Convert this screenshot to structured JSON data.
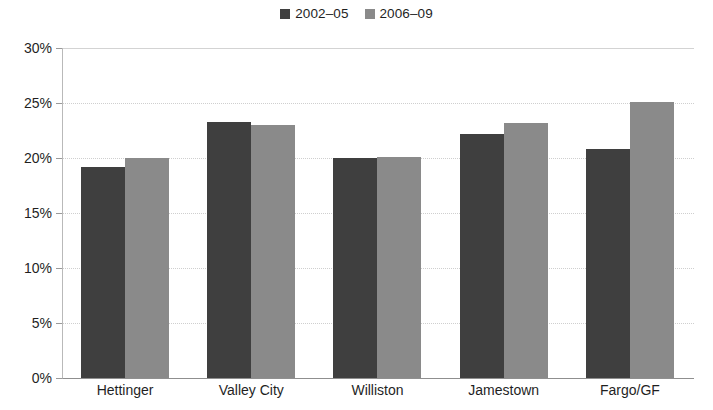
{
  "chart_data": {
    "type": "bar",
    "title": "",
    "subtitle": "",
    "xlabel": "",
    "ylabel": "",
    "categories": [
      "Hettinger",
      "Valley City",
      "Williston",
      "Jamestown",
      "Fargo/GF"
    ],
    "series": [
      {
        "name": "2002–05",
        "color": "#3f3f3f",
        "values": [
          19.2,
          23.3,
          20.0,
          22.2,
          20.8
        ]
      },
      {
        "name": "2006–09",
        "color": "#8a8a8a",
        "values": [
          20.0,
          23.0,
          20.1,
          23.2,
          25.1
        ]
      }
    ],
    "ylim": [
      0,
      30
    ],
    "ytick_values": [
      0,
      5,
      10,
      15,
      20,
      25,
      30
    ],
    "ytick_labels": [
      "0%",
      "5%",
      "10%",
      "15%",
      "20%",
      "25%",
      "30%"
    ],
    "grid": true,
    "grid_axis": "y",
    "legend_position": "top-center",
    "value_format": "percent"
  },
  "legend": {
    "items": [
      {
        "label": "2002–05",
        "color": "#3f3f3f"
      },
      {
        "label": "2006–09",
        "color": "#8a8a8a"
      }
    ]
  },
  "colors": {
    "series_1": "#3f3f3f",
    "series_2": "#8a8a8a",
    "gridline": "#cfcfcf",
    "axis": "#8f8f8f",
    "text": "#1f1f1f",
    "background": "#ffffff"
  }
}
